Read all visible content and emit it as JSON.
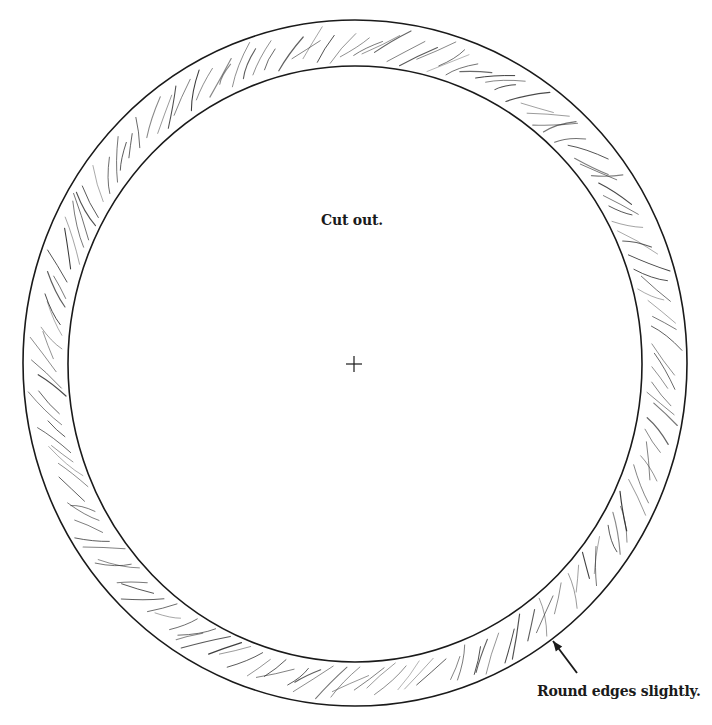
{
  "diagram": {
    "type": "woodworking-template",
    "canvas": {
      "width": 712,
      "height": 725,
      "background": "#ffffff"
    },
    "colors": {
      "line": "#1a1a1a",
      "grain": "#2a2a2a",
      "text": "#1a1a1a"
    },
    "outer_ring": {
      "cx": 355,
      "cy": 363,
      "rx": 332,
      "ry": 343
    },
    "inner_ring": {
      "cx": 355,
      "cy": 364,
      "rx": 287,
      "ry": 298
    },
    "center_mark": {
      "x": 354,
      "y": 364,
      "size": 8,
      "symbol": "crosshair"
    },
    "annotations": {
      "cut_out": "Cut out.",
      "round_edges": "Round edges slightly."
    },
    "arrow": {
      "from": [
        577,
        673
      ],
      "to": [
        553,
        641
      ]
    },
    "grain_count": 150
  }
}
